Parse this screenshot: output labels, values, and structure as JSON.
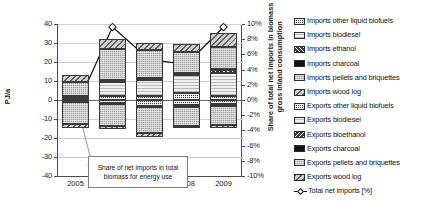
{
  "chart_data": {
    "type": "bar",
    "title": "",
    "xlabel": "",
    "ylabel": "PJ/a",
    "ylabel_secondary": "Share of total net imports in biomass gross inland consumption",
    "categories": [
      "2005",
      "2006",
      "2007",
      "2008",
      "2009"
    ],
    "ylim": [
      -40,
      40
    ],
    "yticks": [
      "40",
      "30",
      "20",
      "10",
      "0",
      "-10",
      "-20",
      "-30",
      "-40"
    ],
    "ylim_secondary": [
      -10,
      10
    ],
    "yticks_secondary": [
      "10%",
      "8%",
      "6%",
      "4%",
      "2%",
      "0%",
      "-2%",
      "-4%",
      "-6%",
      "-8%",
      "-10%"
    ],
    "grid": true,
    "legend_position": "right",
    "stacked": true,
    "series": [
      {
        "name": "Imports other liquid biofuels",
        "pattern": "imp-other",
        "values": [
          0.5,
          2.0,
          2.0,
          3.6,
          2.0
        ]
      },
      {
        "name": "Imports biodiesel",
        "pattern": "imp-biodiesel",
        "values": [
          0.8,
          7.5,
          8.5,
          9.6,
          12.1
        ]
      },
      {
        "name": "Imports ethanol",
        "pattern": "imp-ethanol",
        "values": [
          0.4,
          0.4,
          0.4,
          0.6,
          1.6
        ]
      },
      {
        "name": "Imports charcoal",
        "pattern": "imp-charcoal",
        "values": [
          0.5,
          0.5,
          0.5,
          0.5,
          0.5
        ]
      },
      {
        "name": "Imports pellets and briquettes",
        "pattern": "imp-pellets",
        "values": [
          7.4,
          16.6,
          14.8,
          11.0,
          11.5
        ]
      },
      {
        "name": "Imports wood log",
        "pattern": "imp-woodlog",
        "values": [
          3.6,
          5.0,
          3.6,
          4.0,
          7.8
        ]
      },
      {
        "name": "Exports other liquid biofuels",
        "pattern": "exp-other",
        "values": [
          -0.3,
          -1.4,
          -3.3,
          -2.4,
          -1.9
        ]
      },
      {
        "name": "Exports biodiesel",
        "pattern": "exp-biodiesel",
        "values": [
          -0.2,
          -0.2,
          -0.2,
          -0.3,
          -0.3
        ]
      },
      {
        "name": "Exports bioethanol",
        "pattern": "exp-bioethanol",
        "values": [
          -0.2,
          -0.2,
          -0.2,
          -0.2,
          -0.2
        ]
      },
      {
        "name": "Exports charcoal",
        "pattern": "exp-charcoal",
        "values": [
          -0.2,
          -0.2,
          -0.2,
          -1.0,
          -0.5
        ]
      },
      {
        "name": "Exports pellets and briquettes",
        "pattern": "exp-pellets",
        "values": [
          -11.8,
          -11.5,
          -13.6,
          -9.6,
          -10.3
        ]
      },
      {
        "name": "Exports wood log",
        "pattern": "exp-woodlog",
        "values": [
          -2.0,
          -1.7,
          -1.8,
          -1.5,
          -1.6
        ]
      }
    ],
    "line_series": {
      "name": "Total net imports [%]",
      "unit": "%",
      "axis": "secondary",
      "marker": "open-diamond",
      "values": [
        -1.2,
        9.6,
        5.3,
        4.7,
        9.6
      ]
    },
    "annotation": {
      "text": "Share of net imports in total biomass for energy use"
    }
  },
  "legend": {
    "items": [
      {
        "label": "Imports other liquid biofuels",
        "pattern": "imp-other"
      },
      {
        "label": "Imports biodiesel",
        "pattern": "imp-biodiesel"
      },
      {
        "label": "Imports ethanol",
        "pattern": "imp-ethanol"
      },
      {
        "label": "Imports charcoal",
        "pattern": "imp-charcoal"
      },
      {
        "label": "Imports pellets and briquettes",
        "pattern": "imp-pellets"
      },
      {
        "label": "Imports wood log",
        "pattern": "imp-woodlog"
      },
      {
        "label": "Exports other liquid biofuels",
        "pattern": "exp-other"
      },
      {
        "label": "Exports biodiesel",
        "pattern": "exp-biodiesel"
      },
      {
        "label": "Exports bioethanol",
        "pattern": "exp-bioethanol"
      },
      {
        "label": "Exports charcoal",
        "pattern": "exp-charcoal"
      },
      {
        "label": "Exports pellets and briquettes",
        "pattern": "exp-pellets"
      },
      {
        "label": "Exports wood log",
        "pattern": "exp-woodlog"
      }
    ],
    "line_label": "Total net imports [%]"
  },
  "colors": {
    "grid": "#d0d0d0",
    "axis": "#4d4d4d",
    "zero": "#6b6b6b",
    "line": "#111111",
    "text": "#1a1a1a"
  }
}
